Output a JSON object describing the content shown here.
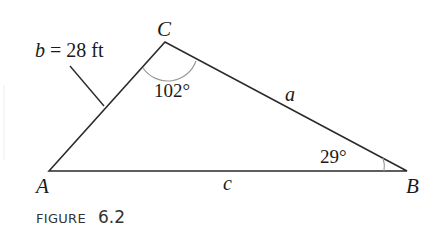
{
  "diagram": {
    "vertices": {
      "A": {
        "label": "A"
      },
      "B": {
        "label": "B"
      },
      "C": {
        "label": "C"
      }
    },
    "sides": {
      "a": {
        "label": "a"
      },
      "b": {
        "label": "b = 28 ft",
        "var": "b",
        "value": "= 28 ft"
      },
      "c": {
        "label": "c"
      }
    },
    "angles": {
      "C": "102°",
      "B": "29°"
    },
    "caption": {
      "word": "FIGURE",
      "number": "6.2"
    },
    "colors": {
      "line": "#2a2a2a",
      "arc": "#9a9a9a",
      "background": "#ffffff"
    }
  }
}
